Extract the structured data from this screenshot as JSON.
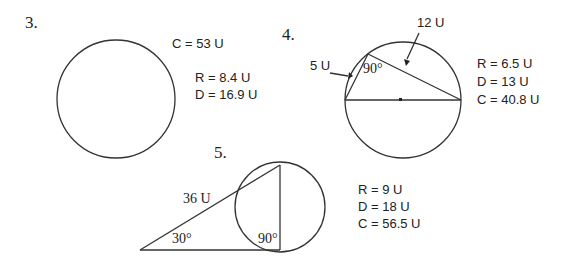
{
  "problems": [
    {
      "number": "3.",
      "labels": {
        "circumference": "C = 53 U",
        "radius": "R = 8.4 U",
        "diameter": "D = 16.9 U"
      }
    },
    {
      "number": "4.",
      "side_labels": {
        "short": "5 U",
        "long": "12 U"
      },
      "angle": "90°",
      "labels": {
        "radius": "R = 6.5 U",
        "diameter": "D = 13 U",
        "circumference": "C = 40.8 U"
      }
    },
    {
      "number": "5.",
      "side_label": "36 U",
      "angles": {
        "left": "30°",
        "right": "90°"
      },
      "labels": {
        "radius": "R = 9 U",
        "diameter": "D = 18 U",
        "circumference": "C = 56.5 U"
      }
    }
  ]
}
